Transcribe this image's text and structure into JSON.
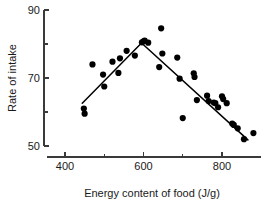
{
  "chart_data": {
    "type": "scatter",
    "title": "",
    "xlabel": "Energy content of food (J/g)",
    "ylabel": "Rate of intake",
    "xlim": [
      355,
      900
    ],
    "ylim": [
      46,
      91
    ],
    "grid": false,
    "legend": null,
    "x_ticks_major": [
      400,
      600,
      800
    ],
    "x_tick_labels": [
      "400",
      "600",
      "800"
    ],
    "x_ticks_minor": [
      500,
      700
    ],
    "y_ticks_major": [
      50,
      70,
      90
    ],
    "y_tick_labels": [
      "50",
      "70",
      "90"
    ],
    "y_ticks_minor": [
      60,
      80
    ],
    "marker": "filled-circle",
    "marker_color": "#000000",
    "marker_size": 3.1,
    "points": [
      {
        "x": 448,
        "y": 61.0
      },
      {
        "x": 450,
        "y": 59.5
      },
      {
        "x": 470,
        "y": 74.0
      },
      {
        "x": 497,
        "y": 71.0
      },
      {
        "x": 500,
        "y": 67.5
      },
      {
        "x": 521,
        "y": 74.8
      },
      {
        "x": 536,
        "y": 71.5
      },
      {
        "x": 540,
        "y": 75.8
      },
      {
        "x": 557,
        "y": 78.0
      },
      {
        "x": 578,
        "y": 76.6
      },
      {
        "x": 596,
        "y": 80.5
      },
      {
        "x": 600,
        "y": 80.8
      },
      {
        "x": 603,
        "y": 81.0
      },
      {
        "x": 612,
        "y": 80.4
      },
      {
        "x": 640,
        "y": 73.2
      },
      {
        "x": 645,
        "y": 84.6
      },
      {
        "x": 648,
        "y": 77.2
      },
      {
        "x": 686,
        "y": 76.0
      },
      {
        "x": 692,
        "y": 69.8
      },
      {
        "x": 700,
        "y": 58.2
      },
      {
        "x": 728,
        "y": 71.4
      },
      {
        "x": 730,
        "y": 70.3
      },
      {
        "x": 736,
        "y": 63.5
      },
      {
        "x": 762,
        "y": 64.8
      },
      {
        "x": 766,
        "y": 63.2
      },
      {
        "x": 779,
        "y": 62.8
      },
      {
        "x": 783,
        "y": 62.6
      },
      {
        "x": 790,
        "y": 61.4
      },
      {
        "x": 800,
        "y": 64.6
      },
      {
        "x": 803,
        "y": 63.8
      },
      {
        "x": 812,
        "y": 62.6
      },
      {
        "x": 826,
        "y": 56.6
      },
      {
        "x": 830,
        "y": 56.2
      },
      {
        "x": 840,
        "y": 55.2
      },
      {
        "x": 856,
        "y": 52.0
      },
      {
        "x": 880,
        "y": 53.8
      }
    ],
    "fit_segments": [
      {
        "name": "rising-segment",
        "points": [
          {
            "x": 444,
            "y": 62.6
          },
          {
            "x": 595,
            "y": 80.3
          }
        ]
      },
      {
        "name": "falling-segment",
        "points": [
          {
            "x": 595,
            "y": 80.3
          },
          {
            "x": 866,
            "y": 51.8
          }
        ]
      }
    ]
  }
}
